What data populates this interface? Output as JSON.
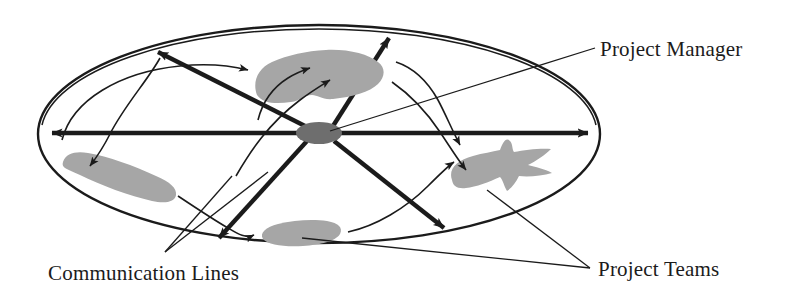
{
  "diagram": {
    "type": "organizational-communication-diagram",
    "background_color": "#ffffff",
    "ink_color": "#1b1b1b",
    "team_fill_color": "#a6a6a6",
    "manager_fill_color": "#6e6e6e",
    "labels": {
      "project_manager": "Project Manager",
      "communication_lines": "Communication Lines",
      "project_teams": "Project Teams"
    },
    "boundary": {
      "name": "organization-boundary-ellipse",
      "center_x": 319,
      "center_y": 134,
      "radius_x": 281,
      "radius_y": 109,
      "double_outline": true
    },
    "hub": {
      "name": "project-manager-hub",
      "center_x": 319,
      "center_y": 133,
      "radius_x": 23,
      "radius_y": 11,
      "spoke_count": 6
    },
    "teams": [
      {
        "name": "team-top",
        "center_x": 318,
        "center_y": 76
      },
      {
        "name": "team-left",
        "center_x": 118,
        "center_y": 178
      },
      {
        "name": "team-right",
        "center_x": 505,
        "center_y": 178
      },
      {
        "name": "team-bottom",
        "center_x": 300,
        "center_y": 233
      }
    ],
    "spokes": [
      {
        "name": "spoke-west",
        "to_x": 46,
        "to_y": 133
      },
      {
        "name": "spoke-east",
        "to_x": 594,
        "to_y": 133
      },
      {
        "name": "spoke-northwest",
        "to_x": 152,
        "to_y": 48
      },
      {
        "name": "spoke-northeast",
        "to_x": 392,
        "to_y": 32
      },
      {
        "name": "spoke-southwest",
        "to_x": 215,
        "to_y": 243
      },
      {
        "name": "spoke-southeast",
        "to_x": 448,
        "to_y": 233
      }
    ],
    "communication_arrow_count": 8
  }
}
